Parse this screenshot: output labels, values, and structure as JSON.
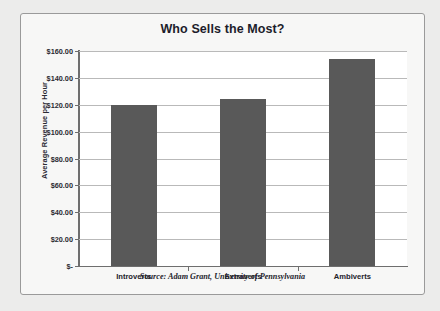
{
  "chart_data": {
    "type": "bar",
    "title": "Who Sells the Most?",
    "xlabel": "",
    "ylabel": "Average Revenue per Hour",
    "categories": [
      "Introverts",
      "Extraverts",
      "Ambiverts"
    ],
    "values": [
      120.0,
      124.5,
      154.0
    ],
    "ylim": [
      0,
      160
    ],
    "ytick_values": [
      0,
      20,
      40,
      60,
      80,
      100,
      120,
      140,
      160
    ],
    "ytick_labels": [
      "$-",
      "$20.00",
      "$40.00",
      "$60.00",
      "$80.00",
      "$100.00",
      "$120.00",
      "$140.00",
      "$160.00"
    ],
    "grid": true,
    "legend": null,
    "annotations": [
      "Source: Adam Grant, University of Pennsylvania"
    ],
    "series": [
      {
        "name": "Average Revenue per Hour",
        "values": [
          120.0,
          124.5,
          154.0
        ]
      }
    ]
  },
  "figure": {
    "title": "Who Sells the Most?",
    "source_note": "Source: Adam Grant, University of Pennsylvania",
    "y_axis_title": "Average Revenue per Hour"
  },
  "colors": {
    "bar_fill": "#595959",
    "plot_background": "#ffffff",
    "page_background": "#ececeb",
    "card_background": "#f7f7f6",
    "frame_border": "#9a9a9a",
    "gridline": "#b9b9b9",
    "axis_line": "#6e6e6e",
    "title_text": "#1d1d2b",
    "label_text": "#2b2b33"
  }
}
